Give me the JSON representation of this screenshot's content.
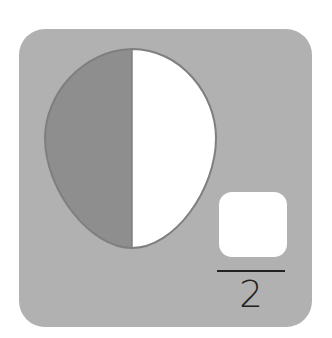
{
  "figure": {
    "type": "fraction-exercise",
    "shape": "egg",
    "parts_total": 2,
    "parts_shaded": 1,
    "shaded_side": "left",
    "fraction": {
      "numerator": "",
      "denominator": "2"
    },
    "colors": {
      "card_background": "#b1b1b1",
      "shaded_fill": "#8e8e8e",
      "unshaded_fill": "#ffffff",
      "outline": "#7f7f7f",
      "answer_box": "#ffffff",
      "text": "#222222"
    }
  }
}
